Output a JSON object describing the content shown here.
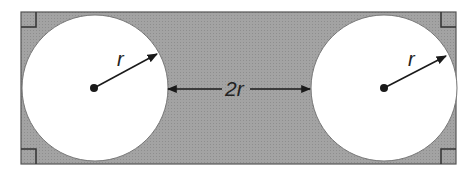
{
  "diagram": {
    "colors": {
      "rectangle_fill": "#9a9a9a",
      "rectangle_stroke": "#555555",
      "circle_fill": "#ffffff",
      "line": "#1a1a1a"
    },
    "labels": {
      "left_radius": "r",
      "right_radius": "r",
      "gap": "2r"
    },
    "right_angle_marks": 4
  }
}
